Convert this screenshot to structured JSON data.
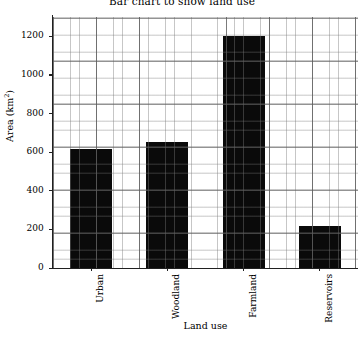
{
  "chart_data": {
    "type": "bar",
    "title": "Bar chart to show land use",
    "xlabel": "Land use",
    "ylabel": "Area (km",
    "ylabel_sup": "2",
    "ylabel_tail": ")",
    "ylabel_full": "Area (km²)",
    "categories": [
      "Urban",
      "Woodland",
      "Farmland",
      "Reservoirs"
    ],
    "values": [
      615,
      655,
      1200,
      220
    ],
    "ylim": [
      0,
      1300
    ],
    "xlim": [
      0,
      4
    ],
    "yticks": [
      0,
      200,
      400,
      600,
      800,
      1000,
      1200
    ],
    "ytick_labels": [
      "0",
      "200",
      "400",
      "600",
      "800",
      "1000",
      "1200"
    ],
    "grid": true,
    "grid_minor": true,
    "legend": null,
    "bar_color": "#0a0a0a",
    "bar_width_fraction": 0.55,
    "xtick_rotation": -90
  },
  "colors": {
    "background": "#ffffff",
    "bar": "#0a0a0a",
    "grid_major": "#5a5a5a",
    "grid_minor": "#787878",
    "axis": "#202020",
    "text": "#000000"
  }
}
